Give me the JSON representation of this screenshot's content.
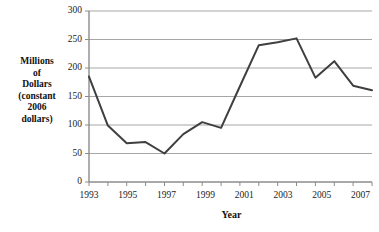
{
  "chart_data": {
    "type": "line",
    "title": "",
    "xlabel": "Year",
    "ylabel": "Millions of Dollars (constant 2006 dollars)",
    "ylabel_lines": [
      "Millions",
      "of",
      "Dollars",
      "(constant",
      "2006",
      "dollars)"
    ],
    "x": [
      1993,
      1994,
      1995,
      1996,
      1997,
      1998,
      1999,
      2000,
      2001,
      2002,
      2003,
      2004,
      2005,
      2006,
      2007,
      2008
    ],
    "values": [
      185,
      99,
      68,
      70,
      50,
      84,
      105,
      95,
      168,
      240,
      245,
      252,
      183,
      212,
      169,
      161
    ],
    "series": [
      {
        "name": "Millions of Dollars (constant 2006 dollars)",
        "values": [
          185,
          99,
          68,
          70,
          50,
          84,
          105,
          95,
          168,
          240,
          245,
          252,
          183,
          212,
          169,
          161
        ]
      }
    ],
    "xlim": [
      1993,
      2008
    ],
    "ylim": [
      0,
      300
    ],
    "yticks": [
      0,
      50,
      100,
      150,
      200,
      250,
      300
    ],
    "ytick_labels": [
      "0",
      "50",
      "100",
      "150",
      "200",
      "250",
      "300"
    ],
    "xticks": [
      1993,
      1994,
      1995,
      1996,
      1997,
      1998,
      1999,
      2000,
      2001,
      2002,
      2003,
      2004,
      2005,
      2006,
      2007,
      2008
    ],
    "xtick_labels_shown": [
      "1993",
      "1995",
      "1997",
      "1999",
      "2001",
      "2003",
      "2005",
      "2007"
    ],
    "xtick_labels_shown_values": [
      1993,
      1995,
      1997,
      1999,
      2001,
      2003,
      2005,
      2007
    ],
    "grid": "horizontal",
    "legend": "none",
    "colors": {
      "line": "#3f3f3f",
      "grid": "#a6a6a6",
      "axis": "#808080",
      "background": "#ffffff",
      "text": "#1a1a1a"
    }
  }
}
